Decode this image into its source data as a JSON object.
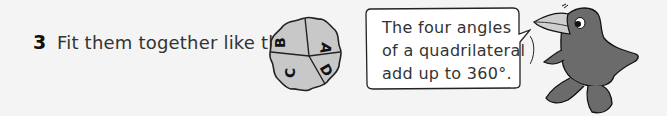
{
  "step": {
    "number": "3",
    "instruction": "Fit them together like this:"
  },
  "figure": {
    "pieces": [
      "A",
      "B",
      "C",
      "D"
    ],
    "fill_color": "#c8c8c8",
    "stroke_color": "#222222"
  },
  "speech_bubble": {
    "lines": [
      "The four angles",
      "of a quadrilateral",
      "add up to 360°."
    ]
  },
  "mascot": {
    "description": "grey cartoon crow",
    "body_color": "#6b6b6b",
    "beak_color": "#cfcfcf"
  }
}
